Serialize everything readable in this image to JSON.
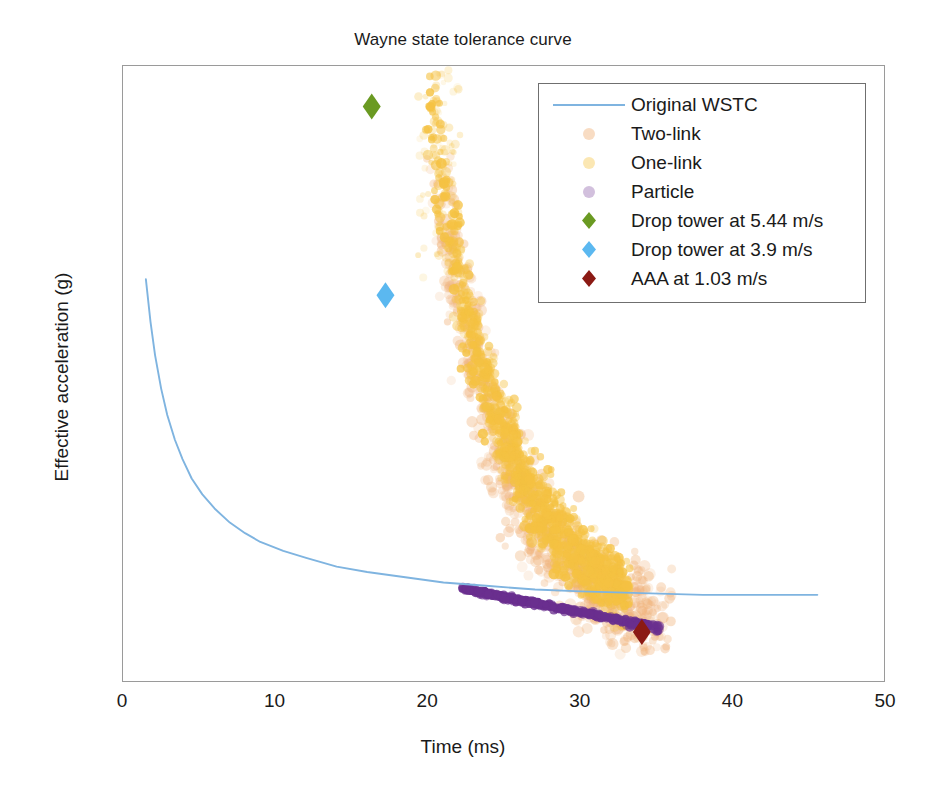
{
  "chart_data": {
    "type": "scatter",
    "title": "Wayne state tolerance curve",
    "xlabel": "Time (ms)",
    "ylabel": "Effective acceleration (g)",
    "xlim": [
      0,
      50
    ],
    "ylim": [
      0,
      350
    ],
    "xticks": [
      0,
      10,
      20,
      30,
      40,
      50
    ],
    "yticks": [
      0,
      50,
      100,
      150,
      200,
      250,
      300,
      350
    ],
    "grid": false,
    "legend_position": "top-right",
    "series": [
      {
        "name": "Original WSTC",
        "type": "line",
        "color": "#7fb4e0",
        "points": [
          [
            1.5,
            229
          ],
          [
            1.8,
            205
          ],
          [
            2.1,
            186
          ],
          [
            2.5,
            167
          ],
          [
            2.9,
            152
          ],
          [
            3.4,
            138
          ],
          [
            3.9,
            127
          ],
          [
            4.5,
            116
          ],
          [
            5.2,
            107
          ],
          [
            6.0,
            99
          ],
          [
            7.0,
            91
          ],
          [
            8.0,
            85
          ],
          [
            9.0,
            80
          ],
          [
            10.5,
            75
          ],
          [
            12.0,
            71
          ],
          [
            14.0,
            66
          ],
          [
            16.0,
            63
          ],
          [
            18.5,
            60
          ],
          [
            21.0,
            57
          ],
          [
            24.0,
            55
          ],
          [
            27.0,
            53
          ],
          [
            30.0,
            52
          ],
          [
            34.0,
            51
          ],
          [
            38.0,
            50
          ],
          [
            42.0,
            50
          ],
          [
            45.5,
            50
          ]
        ]
      },
      {
        "name": "Two-link",
        "type": "scatter",
        "color": "#f0b27a",
        "marker": "circle",
        "n_points": 900,
        "x_range": [
          19.5,
          37.5
        ],
        "y_range": [
          20,
          290
        ],
        "description": "Salmon/peach cloud overlapping the One-link cloud, extending lower and further right"
      },
      {
        "name": "One-link",
        "type": "scatter",
        "color": "#f5c242",
        "marker": "circle",
        "n_points": 1600,
        "x_range": [
          19.5,
          34.5
        ],
        "y_range": [
          28,
          345
        ],
        "description": "Dense gold/amber cloud descending from upper-left to lower-right"
      },
      {
        "name": "Particle",
        "type": "scatter",
        "color": "#6a2f8f",
        "marker": "circle",
        "n_points": 420,
        "x_range": [
          22.2,
          34.5
        ],
        "y_range": [
          30,
          55
        ],
        "description": "Narrow purple band sloping gently down from about 53 g at 22 ms to 32 g at 34.5 ms"
      },
      {
        "name": "Drop tower at 5.44 m/s",
        "type": "marker",
        "color": "#6a9a22",
        "marker": "diamond",
        "points": [
          [
            16.3,
            327
          ]
        ]
      },
      {
        "name": "Drop tower at 3.9 m/s",
        "type": "marker",
        "color": "#5bb8f0",
        "marker": "diamond",
        "points": [
          [
            17.2,
            220
          ]
        ]
      },
      {
        "name": "AAA at 1.03 m/s",
        "type": "marker",
        "color": "#8b1a14",
        "marker": "diamond",
        "points": [
          [
            34.0,
            29
          ]
        ]
      }
    ],
    "legend_entries": [
      "Original WSTC",
      "Two-link",
      "One-link",
      "Particle",
      "Drop tower at 5.44 m/s",
      "Drop tower at 3.9 m/s",
      "AAA at 1.03 m/s"
    ]
  },
  "colors": {
    "wstc_line": "#7fb4e0",
    "two_link": "#f0b27a",
    "one_link": "#f5c242",
    "particle": "#6a2f8f",
    "drop_tower_544": "#6a9a22",
    "drop_tower_39": "#5bb8f0",
    "aaa_103": "#8b1a14",
    "axis": "#9a9a9a",
    "text": "#1a1a1a",
    "background": "#ffffff"
  }
}
